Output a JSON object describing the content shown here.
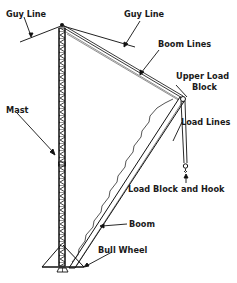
{
  "diagram": {
    "type": "labeled-illustration",
    "labels": [
      {
        "id": "guy-line-left",
        "text": "Guy Line",
        "x": 6,
        "y": 10
      },
      {
        "id": "guy-line-right",
        "text": "Guy Line",
        "x": 124,
        "y": 10
      },
      {
        "id": "boom-lines",
        "text": "Boom Lines",
        "x": 158,
        "y": 40
      },
      {
        "id": "upper-load-block-1",
        "text": "Upper Load",
        "x": 176,
        "y": 72
      },
      {
        "id": "upper-load-block-2",
        "text": "Block",
        "x": 192,
        "y": 83
      },
      {
        "id": "load-lines",
        "text": "Load Lines",
        "x": 181,
        "y": 118
      },
      {
        "id": "mast",
        "text": "Mast",
        "x": 6,
        "y": 106
      },
      {
        "id": "load-block-and-hook",
        "text": "Load Block and Hook",
        "x": 128,
        "y": 185
      },
      {
        "id": "boom",
        "text": "Boom",
        "x": 129,
        "y": 220
      },
      {
        "id": "bull-wheel",
        "text": "Bull Wheel",
        "x": 98,
        "y": 246
      }
    ]
  }
}
